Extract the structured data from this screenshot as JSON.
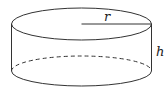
{
  "diagram": {
    "shape": "cylinder",
    "labels": {
      "radius": "r",
      "height": "h"
    },
    "colors": {
      "stroke": "#333333",
      "background": "#ffffff"
    }
  }
}
